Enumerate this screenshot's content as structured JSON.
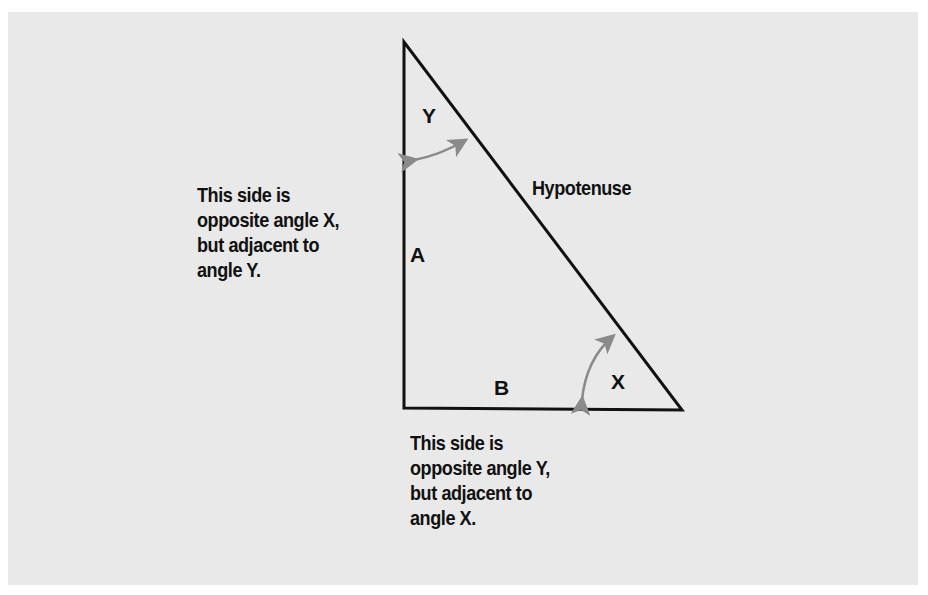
{
  "diagram": {
    "type": "right-triangle",
    "vertices": {
      "top": [
        404,
        42
      ],
      "right_angle": [
        404,
        408
      ],
      "bottom_right": [
        682,
        410
      ]
    },
    "colors": {
      "background": "#e9e9e9",
      "line": "#111111",
      "arrow": "#8a8a8a",
      "text": "#111111"
    },
    "labels": {
      "angle_y": "Y",
      "angle_x": "X",
      "side_a": "A",
      "side_b": "B",
      "hypotenuse": "Hypotenuse"
    },
    "annotations": {
      "side_a_note": "This side is\nopposite angle X,\nbut adjacent to\nangle Y.",
      "side_b_note": "This side is\nopposite angle Y,\nbut adjacent to\nangle X."
    },
    "arrows": [
      {
        "name": "angle-y-arc-arrow",
        "from": [
          412,
          160
        ],
        "to": [
          466,
          140
        ]
      },
      {
        "name": "angle-x-arc-arrow",
        "from": [
          581,
          402
        ],
        "to": [
          614,
          335
        ]
      }
    ]
  }
}
